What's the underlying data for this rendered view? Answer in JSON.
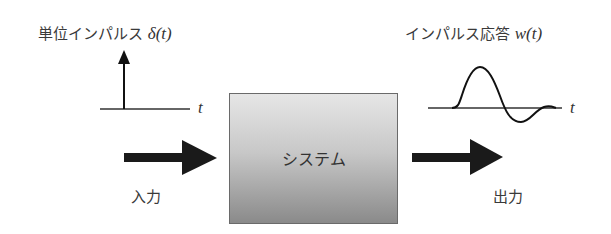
{
  "input": {
    "signal_label": "単位インパルス",
    "signal_symbol": "δ(t)",
    "axis_label": "t",
    "arrow_label": "入力"
  },
  "system": {
    "label": "システム"
  },
  "output": {
    "signal_label": "インパルス応答",
    "signal_symbol": "w(t)",
    "axis_label": "t",
    "arrow_label": "出力"
  },
  "colors": {
    "stroke": "#1a1a1a",
    "box_top": "#e6e6e6",
    "box_bottom": "#8a8a8a"
  }
}
